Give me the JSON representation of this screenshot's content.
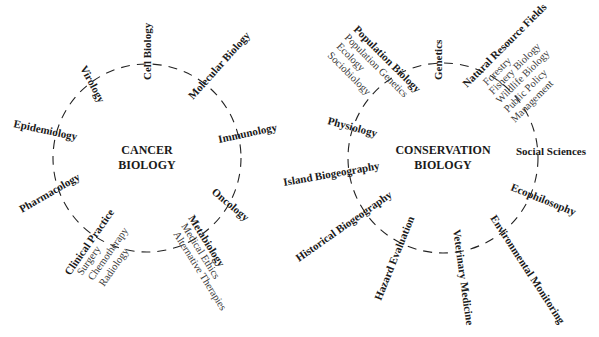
{
  "diagrams": {
    "cancer": {
      "title_line1": "CANCER",
      "title_line2": "BIOLOGY",
      "fields": {
        "cell_biology": "Cell Biology",
        "molecular_biology": "Molecular Biology",
        "immunology": "Immunology",
        "oncology": "Oncology",
        "metabiology": {
          "label": "Metabiology",
          "sub": [
            "Medical Ethics",
            "Alternative Therapies"
          ]
        },
        "clinical_practice": {
          "label": "Clinical Practice",
          "sub": [
            "Surgery",
            "Chemotherapy",
            "Radiology"
          ]
        },
        "pharmacology": "Pharmacology",
        "epidemiology": "Epidemiology",
        "virology": "Virology"
      }
    },
    "conservation": {
      "title_line1": "CONSERVATION",
      "title_line2": "BIOLOGY",
      "fields": {
        "genetics": "Genetics",
        "natural_resource_fields": {
          "label": "Natural Resource Fields",
          "sub": [
            "Forestry",
            "Fishery Biology",
            "Wildlife Biology",
            "Public Policy",
            "Management"
          ]
        },
        "social_sciences": "Social Sciences",
        "ecophilosophy": "Ecophilosophy",
        "environmental_monitoring": "Environmental Monitoring",
        "veterinary_medicine": "Veterinary Medicine",
        "hazard_evaluation": "Hazard Evaluation",
        "historical_biogeography": "Historical Biogeography",
        "island_biogeography": "Island Biogeography",
        "physiology": "Physiology",
        "population_biology": {
          "label": "Population Biology",
          "sub": [
            "Population Genetics",
            "Ecology",
            "Sociobiology"
          ]
        }
      }
    }
  }
}
